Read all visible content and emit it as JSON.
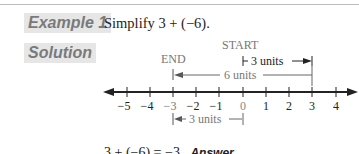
{
  "example": {
    "label": "Example 1",
    "problem": "Simplify 3 + (−6)."
  },
  "solution": {
    "label": "Solution",
    "start_label": "START",
    "end_label": "END",
    "arrows": [
      {
        "label": "3 units",
        "from": 0,
        "to": 3,
        "direction": "right"
      },
      {
        "label": "6 units",
        "from": 3,
        "to": -3,
        "direction": "left"
      },
      {
        "label": "3 units",
        "from": -3,
        "to": 0,
        "direction": "span"
      }
    ],
    "number_line": {
      "ticks": [
        "−5",
        "−4",
        "−3",
        "−2",
        "−1",
        "0",
        "1",
        "2",
        "3",
        "4"
      ]
    },
    "result_equation": "3 + (−6) = −3",
    "result_tag": "Answer"
  },
  "colors": {
    "label_bg": "#e6e6e6",
    "label_text": "#7a7a7a",
    "line": "#222222",
    "gray_text": "#777777"
  }
}
